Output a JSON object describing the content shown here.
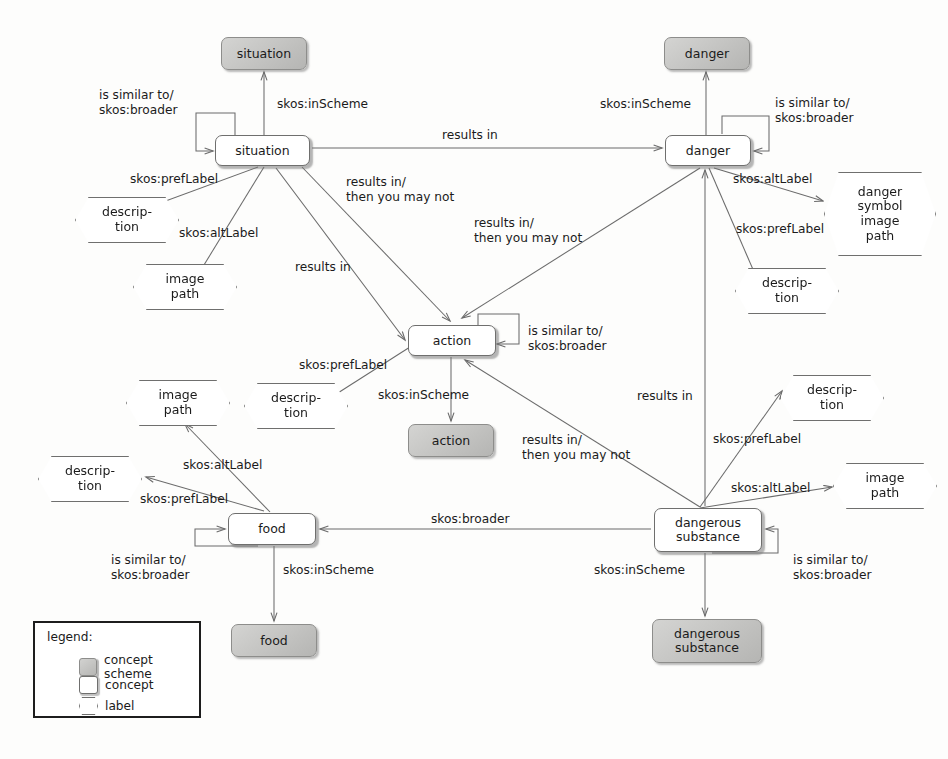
{
  "diagram": {
    "background_color": "#fdfdfc",
    "edge_color": "#6b6b6b",
    "scheme_fill": "#c3c3c1",
    "concept_fill": "#ffffff",
    "text_color": "#1b1b1b"
  },
  "schemes": [
    {
      "id": "scheme-situation",
      "label": "situation",
      "x": 221,
      "y": 37,
      "w": 86,
      "h": 33
    },
    {
      "id": "scheme-danger",
      "label": "danger",
      "x": 664,
      "y": 37,
      "w": 86,
      "h": 33
    },
    {
      "id": "scheme-action",
      "label": "action",
      "x": 408,
      "y": 424,
      "w": 86,
      "h": 33
    },
    {
      "id": "scheme-food",
      "label": "food",
      "x": 231,
      "y": 624,
      "w": 86,
      "h": 33
    },
    {
      "id": "scheme-dangerous-substance",
      "label": "dangerous\nsubstance",
      "x": 652,
      "y": 619,
      "w": 110,
      "h": 44
    }
  ],
  "concepts": [
    {
      "id": "concept-situation",
      "label": "situation",
      "x": 215,
      "y": 135,
      "w": 95,
      "h": 31
    },
    {
      "id": "concept-danger",
      "label": "danger",
      "x": 665,
      "y": 135,
      "w": 86,
      "h": 31
    },
    {
      "id": "concept-action",
      "label": "action",
      "x": 408,
      "y": 325,
      "w": 88,
      "h": 31
    },
    {
      "id": "concept-food",
      "label": "food",
      "x": 228,
      "y": 513,
      "w": 88,
      "h": 32
    },
    {
      "id": "concept-dangerous-substance",
      "label": "dangerous\nsubstance",
      "x": 654,
      "y": 508,
      "w": 108,
      "h": 44
    }
  ],
  "labels": [
    {
      "id": "label-situation-description",
      "text": "descrip-\ntion",
      "x": 75,
      "y": 197,
      "w": 104,
      "h": 46
    },
    {
      "id": "label-situation-image-path",
      "text": "image\npath",
      "x": 133,
      "y": 264,
      "w": 104,
      "h": 46
    },
    {
      "id": "label-danger-symbol-image-path",
      "text": "danger\nsymbol\nimage\npath",
      "x": 824,
      "y": 172,
      "w": 112,
      "h": 84
    },
    {
      "id": "label-danger-description",
      "text": "descrip-\ntion",
      "x": 735,
      "y": 268,
      "w": 104,
      "h": 46
    },
    {
      "id": "label-action-image-path",
      "text": "image\npath",
      "x": 126,
      "y": 380,
      "w": 104,
      "h": 46
    },
    {
      "id": "label-action-description",
      "text": "descrip-\ntion",
      "x": 244,
      "y": 383,
      "w": 104,
      "h": 46
    },
    {
      "id": "label-food-description",
      "text": "descrip-\ntion",
      "x": 38,
      "y": 456,
      "w": 104,
      "h": 46
    },
    {
      "id": "label-ds-description",
      "text": "descrip-\ntion",
      "x": 780,
      "y": 375,
      "w": 104,
      "h": 46
    },
    {
      "id": "label-ds-image-path",
      "text": "image\npath",
      "x": 833,
      "y": 463,
      "w": 104,
      "h": 46
    }
  ],
  "edge_labels": [
    {
      "id": "el-situation-self",
      "text": "is similar to/\nskos:broader",
      "x": 99,
      "y": 88
    },
    {
      "id": "el-situation-inscheme",
      "text": "skos:inScheme",
      "x": 277,
      "y": 97
    },
    {
      "id": "el-situation-results-in",
      "text": "results in",
      "x": 442,
      "y": 128
    },
    {
      "id": "el-danger-inscheme",
      "text": "skos:inScheme",
      "x": 600,
      "y": 97
    },
    {
      "id": "el-danger-self",
      "text": "is similar to/\nskos:broader",
      "x": 775,
      "y": 96
    },
    {
      "id": "el-situation-preflabel",
      "text": "skos:prefLabel",
      "x": 130,
      "y": 172
    },
    {
      "id": "el-situation-altlabel",
      "text": "skos:altLabel",
      "x": 179,
      "y": 226
    },
    {
      "id": "el-danger-altlabel",
      "text": "skos:altLabel",
      "x": 733,
      "y": 172
    },
    {
      "id": "el-danger-preflabel",
      "text": "skos:prefLabel",
      "x": 736,
      "y": 222
    },
    {
      "id": "el-situation-action-1",
      "text": "results in/\nthen you may not",
      "x": 346,
      "y": 175
    },
    {
      "id": "el-danger-action",
      "text": "results in/\nthen you may not",
      "x": 474,
      "y": 216
    },
    {
      "id": "el-situation-action-2",
      "text": "results in",
      "x": 295,
      "y": 260
    },
    {
      "id": "el-action-self",
      "text": "is similar to/\nskos:broader",
      "x": 528,
      "y": 324
    },
    {
      "id": "el-action-preflabel",
      "text": "skos:prefLabel",
      "x": 299,
      "y": 358
    },
    {
      "id": "el-action-inscheme",
      "text": "skos:inScheme",
      "x": 378,
      "y": 388
    },
    {
      "id": "el-ds-results-in",
      "text": "results in",
      "x": 637,
      "y": 389
    },
    {
      "id": "el-ds-action",
      "text": "results in/\nthen you may not",
      "x": 522,
      "y": 433
    },
    {
      "id": "el-ds-preflabel",
      "text": "skos:prefLabel",
      "x": 713,
      "y": 432
    },
    {
      "id": "el-ds-altlabel",
      "text": "skos:altLabel",
      "x": 731,
      "y": 481
    },
    {
      "id": "el-food-altlabel",
      "text": "skos:altLabel",
      "x": 183,
      "y": 458
    },
    {
      "id": "el-food-preflabel",
      "text": "skos:prefLabel",
      "x": 140,
      "y": 492
    },
    {
      "id": "el-ds-broader-food",
      "text": "skos:broader",
      "x": 431,
      "y": 512
    },
    {
      "id": "el-food-self",
      "text": "is similar to/\nskos:broader",
      "x": 111,
      "y": 553
    },
    {
      "id": "el-ds-self",
      "text": "is similar to/\nskos:broader",
      "x": 793,
      "y": 553
    },
    {
      "id": "el-food-inscheme",
      "text": "skos:inScheme",
      "x": 283,
      "y": 563
    },
    {
      "id": "el-ds-inscheme",
      "text": "skos:inScheme",
      "x": 594,
      "y": 563
    }
  ],
  "legend": {
    "title": "legend:",
    "items": [
      {
        "id": "legend-concept-scheme",
        "label": "concept scheme",
        "swatch": "scheme-swatch-icon"
      },
      {
        "id": "legend-concept",
        "label": "concept",
        "swatch": "concept-swatch-icon"
      },
      {
        "id": "legend-label",
        "label": "label",
        "swatch": "label-swatch-icon"
      }
    ]
  }
}
